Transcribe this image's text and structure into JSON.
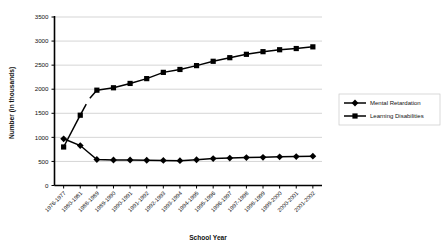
{
  "chart_data": {
    "type": "line",
    "title": "",
    "xlabel": "School Year",
    "ylabel": "Number (in thousands)",
    "ylim": [
      0,
      3500
    ],
    "ytick_step": 500,
    "yticks": [
      "0",
      "500",
      "1000",
      "1500",
      "2000",
      "2500",
      "3000",
      "3500"
    ],
    "grid": true,
    "legend_position": "right",
    "categories": [
      "1976-1977",
      "1980-1981",
      "1988-1989",
      "1989-1990",
      "1990-1991",
      "1991-1992",
      "1992-1993",
      "1993-1994",
      "1994-1995",
      "1995-1996",
      "1996-1997",
      "1997-1998",
      "1998-1999",
      "1999-2000",
      "2000-2001",
      "2001-2002"
    ],
    "series": [
      {
        "name": "Mental Retardation",
        "marker": "diamond",
        "color": "#000000",
        "values": [
          970,
          830,
          540,
          530,
          530,
          525,
          520,
          515,
          535,
          560,
          570,
          580,
          585,
          595,
          600,
          610
        ]
      },
      {
        "name": "Learning Disabilities",
        "marker": "square",
        "color": "#000000",
        "values": [
          800,
          1460,
          1980,
          2030,
          2120,
          2220,
          2350,
          2410,
          2490,
          2580,
          2655,
          2725,
          2780,
          2820,
          2845,
          2880
        ]
      }
    ]
  },
  "legend": {
    "items": [
      {
        "label": "Mental Retardation",
        "marker": "diamond"
      },
      {
        "label": "Learning Disabilities",
        "marker": "square"
      }
    ]
  },
  "axes": {
    "y_title": "Number (in thousands)",
    "x_title": "School Year"
  }
}
